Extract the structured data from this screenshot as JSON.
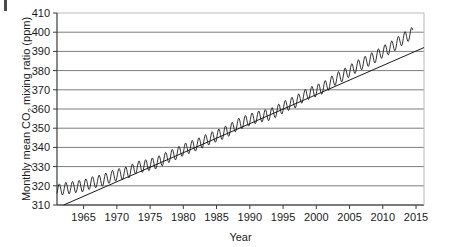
{
  "chart_data": {
    "type": "line",
    "title": "",
    "xlabel": "Year",
    "ylabel": "Monthly mean CO2 mixing ratio (ppm)",
    "ylabel_parts": {
      "pre": "Monthly mean CO",
      "sub": "2",
      "post": " mixing ratio (ppm)"
    },
    "xlim": [
      1961.0,
      2016.2
    ],
    "ylim": [
      310,
      410
    ],
    "ytick_labels": [
      "310",
      "320",
      "330",
      "340",
      "350",
      "360",
      "370",
      "380",
      "390",
      "400",
      "410"
    ],
    "yticks": [
      310,
      320,
      330,
      340,
      350,
      360,
      370,
      380,
      390,
      400,
      410
    ],
    "xtick_labels": [
      "1965",
      "1970",
      "1975",
      "1980",
      "1985",
      "1990",
      "1995",
      "2000",
      "2005",
      "2010",
      "2015"
    ],
    "xticks": [
      1965,
      1970,
      1975,
      1980,
      1985,
      1990,
      1995,
      2000,
      2005,
      2010,
      2015
    ],
    "grid": "horizontal",
    "legend": "none",
    "colors": {
      "data_line": "#1a1a1a",
      "trend_line": "#1a1a1a",
      "gridline": "#7d7d7d",
      "axis": "#3a3a3a",
      "background": "#ffffff"
    },
    "series": [
      {
        "name": "Monthly mean CO2",
        "style": "oscillating-line",
        "seasonal_amplitude_ppm": 3.1,
        "annual_means": [
          {
            "year": 1961,
            "value": 317.6
          },
          {
            "year": 1962,
            "value": 318.5
          },
          {
            "year": 1963,
            "value": 319.0
          },
          {
            "year": 1964,
            "value": 319.6
          },
          {
            "year": 1965,
            "value": 320.0
          },
          {
            "year": 1966,
            "value": 321.4
          },
          {
            "year": 1967,
            "value": 322.2
          },
          {
            "year": 1968,
            "value": 323.0
          },
          {
            "year": 1969,
            "value": 324.6
          },
          {
            "year": 1970,
            "value": 325.7
          },
          {
            "year": 1971,
            "value": 326.3
          },
          {
            "year": 1972,
            "value": 327.5
          },
          {
            "year": 1973,
            "value": 329.7
          },
          {
            "year": 1974,
            "value": 330.2
          },
          {
            "year": 1975,
            "value": 331.1
          },
          {
            "year": 1976,
            "value": 332.0
          },
          {
            "year": 1977,
            "value": 333.8
          },
          {
            "year": 1978,
            "value": 335.4
          },
          {
            "year": 1979,
            "value": 336.8
          },
          {
            "year": 1980,
            "value": 338.7
          },
          {
            "year": 1981,
            "value": 340.1
          },
          {
            "year": 1982,
            "value": 341.4
          },
          {
            "year": 1983,
            "value": 343.0
          },
          {
            "year": 1984,
            "value": 344.6
          },
          {
            "year": 1985,
            "value": 346.0
          },
          {
            "year": 1986,
            "value": 347.4
          },
          {
            "year": 1987,
            "value": 349.2
          },
          {
            "year": 1988,
            "value": 351.6
          },
          {
            "year": 1989,
            "value": 353.1
          },
          {
            "year": 1990,
            "value": 354.4
          },
          {
            "year": 1991,
            "value": 355.6
          },
          {
            "year": 1992,
            "value": 356.4
          },
          {
            "year": 1993,
            "value": 357.1
          },
          {
            "year": 1994,
            "value": 358.8
          },
          {
            "year": 1995,
            "value": 360.8
          },
          {
            "year": 1996,
            "value": 362.6
          },
          {
            "year": 1997,
            "value": 363.8
          },
          {
            "year": 1998,
            "value": 366.6
          },
          {
            "year": 1999,
            "value": 368.3
          },
          {
            "year": 2000,
            "value": 369.5
          },
          {
            "year": 2001,
            "value": 371.0
          },
          {
            "year": 2002,
            "value": 373.2
          },
          {
            "year": 2003,
            "value": 375.8
          },
          {
            "year": 2004,
            "value": 377.5
          },
          {
            "year": 2005,
            "value": 379.8
          },
          {
            "year": 2006,
            "value": 381.9
          },
          {
            "year": 2007,
            "value": 383.8
          },
          {
            "year": 2008,
            "value": 385.6
          },
          {
            "year": 2009,
            "value": 387.4
          },
          {
            "year": 2010,
            "value": 389.9
          },
          {
            "year": 2011,
            "value": 391.6
          },
          {
            "year": 2012,
            "value": 393.8
          },
          {
            "year": 2013,
            "value": 396.5
          },
          {
            "year": 2014,
            "value": 398.6
          }
        ]
      },
      {
        "name": "Linear trend line",
        "style": "straight-line",
        "endpoints": [
          {
            "year": 1962.0,
            "value": 310.0
          },
          {
            "year": 2016.2,
            "value": 392.0
          }
        ]
      }
    ]
  },
  "plot_geometry": {
    "left": 57,
    "right": 424,
    "top": 13,
    "bottom": 205
  }
}
